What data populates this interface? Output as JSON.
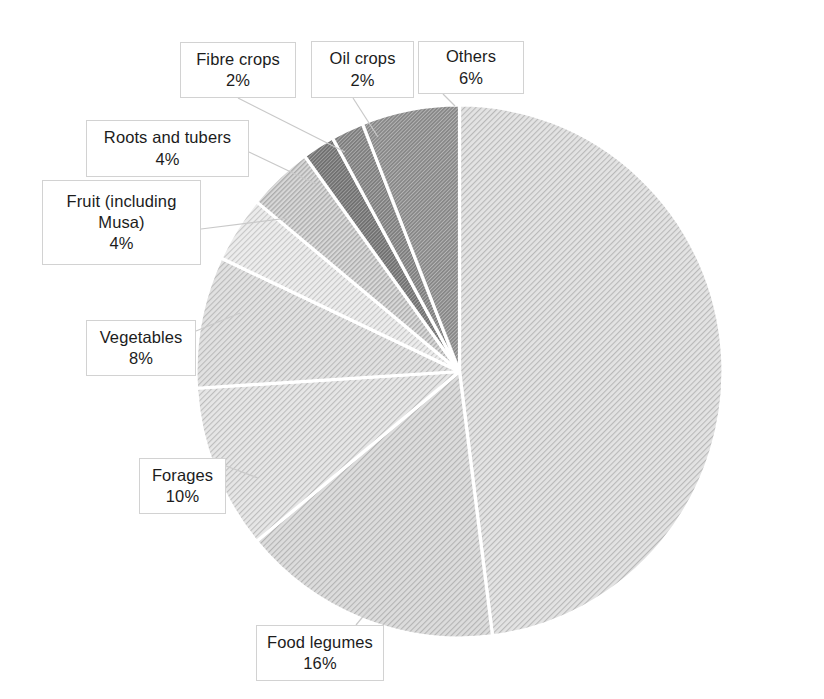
{
  "chart_data": {
    "type": "pie",
    "title": "",
    "xlabel": "",
    "ylabel": "",
    "legend_position": "none",
    "grid": false,
    "units": "percent",
    "start_angle_deg": 0,
    "direction": "clockwise",
    "categories": [
      "Cereals",
      "Food legumes",
      "Forages",
      "Vegetables",
      "Fruit (including Musa)",
      "Roots and tubers",
      "Fibre crops",
      "Oil crops",
      "Others"
    ],
    "values": [
      48,
      16,
      10,
      8,
      4,
      4,
      2,
      2,
      6
    ],
    "labels": [
      "48%",
      "16%",
      "10%",
      "8%",
      "4%",
      "4%",
      "2%",
      "2%",
      "6%"
    ],
    "slices": [
      {
        "name": "Cereals",
        "value": 48,
        "value_label": "48%",
        "fill": "#e3e3e3",
        "hatch_shade": "#b9b9b9",
        "hatch_density": "light",
        "start_deg": 0,
        "end_deg": 172.8
      },
      {
        "name": "Food legumes",
        "value": 16,
        "value_label": "16%",
        "fill": "#dcdcdc",
        "hatch_shade": "#b4b4b4",
        "hatch_density": "light",
        "start_deg": 172.8,
        "end_deg": 230.4
      },
      {
        "name": "Forages",
        "value": 10,
        "value_label": "10%",
        "fill": "#e6e6e6",
        "hatch_shade": "#bdbdbd",
        "hatch_density": "light",
        "start_deg": 230.4,
        "end_deg": 266.4
      },
      {
        "name": "Vegetables",
        "value": 8,
        "value_label": "8%",
        "fill": "#e1e1e1",
        "hatch_shade": "#bababa",
        "hatch_density": "light",
        "start_deg": 266.4,
        "end_deg": 295.2
      },
      {
        "name": "Fruit (including Musa)",
        "value": 4,
        "value_label": "4%",
        "fill": "#ececec",
        "hatch_shade": "#c6c6c6",
        "hatch_density": "light",
        "start_deg": 295.2,
        "end_deg": 309.6
      },
      {
        "name": "Roots and tubers",
        "value": 4,
        "value_label": "4%",
        "fill": "#d8d8d8",
        "hatch_shade": "#adadad",
        "hatch_density": "medium",
        "start_deg": 309.6,
        "end_deg": 324.0
      },
      {
        "name": "Fibre crops",
        "value": 2,
        "value_label": "2%",
        "fill": "#9f9f9f",
        "hatch_shade": "#6e6e6e",
        "hatch_density": "dense",
        "start_deg": 324.0,
        "end_deg": 331.2
      },
      {
        "name": "Oil crops",
        "value": 2,
        "value_label": "2%",
        "fill": "#adadad",
        "hatch_shade": "#7b7b7b",
        "hatch_density": "dense",
        "start_deg": 331.2,
        "end_deg": 338.4
      },
      {
        "name": "Others",
        "value": 6,
        "value_label": "6%",
        "fill": "#b6b6b6",
        "hatch_shade": "#858585",
        "hatch_density": "dense",
        "start_deg": 338.4,
        "end_deg": 360.0
      }
    ],
    "callouts": [
      {
        "name": "Fibre crops",
        "value_label": "2%",
        "box": {
          "x": 180,
          "y": 42,
          "w": 116,
          "h": 56
        },
        "leader": [
          [
            238,
            98
          ],
          [
            345,
            152
          ]
        ]
      },
      {
        "name": "Oil crops",
        "value_label": "2%",
        "box": {
          "x": 311,
          "y": 41,
          "w": 103,
          "h": 57
        },
        "leader": [
          [
            353,
            98
          ],
          [
            378,
            137
          ]
        ]
      },
      {
        "name": "Others",
        "value_label": "6%",
        "box": {
          "x": 418,
          "y": 41,
          "w": 106,
          "h": 53
        },
        "leader": [
          [
            443,
            94
          ],
          [
            455,
            106
          ]
        ]
      },
      {
        "name": "Roots and tubers",
        "value_label": "4%",
        "box": {
          "x": 86,
          "y": 120,
          "w": 163,
          "h": 57
        },
        "leader": [
          [
            249,
            152
          ],
          [
            316,
            184
          ]
        ]
      },
      {
        "name": "Fruit (including Musa)",
        "value_label": "4%",
        "box": {
          "x": 42,
          "y": 180,
          "w": 159,
          "h": 85
        },
        "leader": [
          [
            201,
            229
          ],
          [
            288,
            218
          ]
        ]
      },
      {
        "name": "Vegetables",
        "value_label": "8%",
        "box": {
          "x": 86,
          "y": 320,
          "w": 110,
          "h": 56
        },
        "leader": [
          [
            196,
            331
          ],
          [
            240,
            313
          ]
        ]
      },
      {
        "name": "Forages",
        "value_label": "10%",
        "box": {
          "x": 139,
          "y": 458,
          "w": 87,
          "h": 56
        },
        "leader": [
          [
            226,
            466
          ],
          [
            258,
            478
          ]
        ]
      },
      {
        "name": "Food legumes",
        "value_label": "16%",
        "box": {
          "x": 256,
          "y": 625,
          "w": 128,
          "h": 56
        },
        "leader": [
          [
            356,
            625
          ],
          [
            370,
            608
          ]
        ]
      }
    ]
  },
  "accessibility": {
    "chart_role": "pie-chart",
    "background_color": "#ffffff",
    "label_box_border_color": "#d2d2d2",
    "slice_separator_color": "#ffffff",
    "text_color": "#1c1c1c"
  }
}
